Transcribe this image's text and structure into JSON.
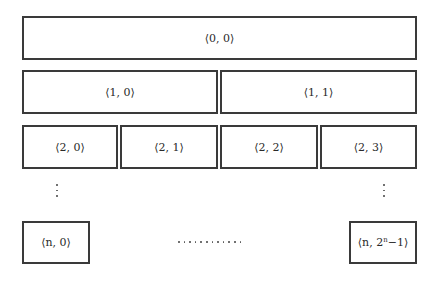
{
  "diagram": {
    "rows": [
      {
        "level": "0",
        "nodes": [
          {
            "label": "⟨0, 0⟩"
          }
        ]
      },
      {
        "level": "1",
        "nodes": [
          {
            "label": "⟨1, 0⟩"
          },
          {
            "label": "⟨1, 1⟩"
          }
        ]
      },
      {
        "level": "2",
        "nodes": [
          {
            "label": "⟨2, 0⟩"
          },
          {
            "label": "⟨2, 1⟩"
          },
          {
            "label": "⟨2, 2⟩"
          },
          {
            "label": "⟨2, 3⟩"
          }
        ]
      },
      {
        "level": "n",
        "nodes": [
          {
            "label": "⟨n, 0⟩"
          },
          {
            "label_prefix": "⟨n, 2",
            "label_sup": "n",
            "label_suffix": "−1⟩"
          }
        ]
      }
    ],
    "ellipsis_vertical": "⋮",
    "ellipsis_horizontal": "…………"
  }
}
